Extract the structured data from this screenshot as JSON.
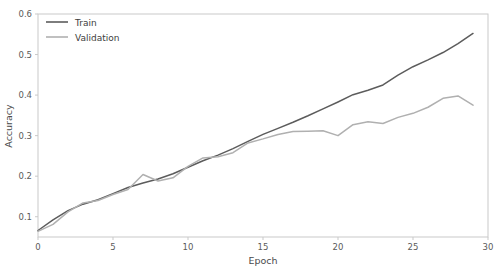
{
  "chart_data": {
    "type": "line",
    "title": "",
    "xlabel": "Epoch",
    "ylabel": "Accuracy",
    "xlim": [
      0,
      30
    ],
    "ylim": [
      0.05,
      0.6
    ],
    "grid": false,
    "legend_position": "upper left",
    "xticks": [
      0,
      5,
      10,
      15,
      20,
      25,
      30
    ],
    "xtick_labels": [
      "0",
      "5",
      "10",
      "15",
      "20",
      "25",
      "30"
    ],
    "yticks": [
      0.1,
      0.2,
      0.3,
      0.4,
      0.5,
      0.6
    ],
    "ytick_labels": [
      "0.1",
      "0.2",
      "0.3",
      "0.4",
      "0.5",
      "0.6"
    ],
    "x": [
      0,
      1,
      2,
      3,
      4,
      5,
      6,
      7,
      8,
      9,
      10,
      11,
      12,
      13,
      14,
      15,
      16,
      17,
      18,
      19,
      20,
      21,
      22,
      23,
      24,
      25,
      26,
      27,
      28,
      29
    ],
    "series": [
      {
        "name": "Train",
        "color": "#5c5c5c",
        "values": [
          0.066,
          0.092,
          0.115,
          0.131,
          0.142,
          0.157,
          0.172,
          0.183,
          0.193,
          0.206,
          0.222,
          0.238,
          0.252,
          0.268,
          0.286,
          0.303,
          0.318,
          0.333,
          0.349,
          0.366,
          0.383,
          0.401,
          0.412,
          0.425,
          0.449,
          0.47,
          0.487,
          0.505,
          0.527,
          0.552
        ]
      },
      {
        "name": "Validation",
        "color": "#b0b0b0",
        "values": [
          0.064,
          0.081,
          0.112,
          0.134,
          0.14,
          0.155,
          0.167,
          0.204,
          0.188,
          0.196,
          0.224,
          0.245,
          0.248,
          0.258,
          0.282,
          0.292,
          0.303,
          0.31,
          0.311,
          0.312,
          0.3,
          0.327,
          0.334,
          0.33,
          0.345,
          0.355,
          0.37,
          0.392,
          0.398,
          0.375
        ]
      }
    ]
  },
  "legend": {
    "entries": [
      {
        "label": "Train"
      },
      {
        "label": "Validation"
      }
    ]
  }
}
